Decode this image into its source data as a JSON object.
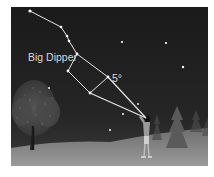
{
  "diagram": {
    "title_label": "Big Dipper",
    "angle_label": "5°",
    "colors": {
      "sky": "#1e1e1e",
      "ground": "#8a8a8a",
      "lines": "#e6e6e6",
      "stars": "#ffffff",
      "label": "#d8d8d8"
    },
    "constellation": {
      "name": "Big Dipper",
      "stars": [
        {
          "x": 30,
          "y": 11
        },
        {
          "x": 61,
          "y": 27
        },
        {
          "x": 67,
          "y": 36
        },
        {
          "x": 69,
          "y": 41
        },
        {
          "x": 77,
          "y": 54
        },
        {
          "x": 68,
          "y": 71
        },
        {
          "x": 90,
          "y": 93
        },
        {
          "x": 108,
          "y": 77
        }
      ]
    },
    "observer_eye": {
      "x": 146,
      "y": 118
    },
    "background_stars": [
      {
        "x": 122,
        "y": 42
      },
      {
        "x": 166,
        "y": 43
      },
      {
        "x": 183,
        "y": 67
      },
      {
        "x": 49,
        "y": 88
      },
      {
        "x": 138,
        "y": 104
      },
      {
        "x": 123,
        "y": 114
      },
      {
        "x": 110,
        "y": 130
      }
    ]
  }
}
